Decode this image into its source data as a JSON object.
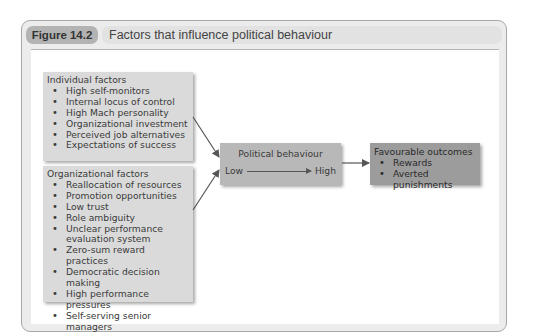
{
  "header": {
    "figure_label": "Figure 14.2",
    "title": "Factors that influence political behaviour"
  },
  "individual_factors": {
    "heading": "Individual factors",
    "items": [
      "High self-monitors",
      "Internal locus of control",
      "High Mach personality",
      "Organizational investment",
      "Perceived job alternatives",
      "Expectations of success"
    ]
  },
  "organizational_factors": {
    "heading": "Organizational factors",
    "items": [
      "Reallocation of resources",
      "Promotion opportunities",
      "Low trust",
      "Role ambiguity",
      "Unclear performance evaluation system",
      "Zero-sum reward practices",
      "Democratic decision making",
      "High performance pressures",
      "Self-serving senior managers"
    ]
  },
  "political_behaviour": {
    "heading": "Political behaviour",
    "low": "Low",
    "high": "High"
  },
  "outcomes": {
    "heading": "Favourable outcomes",
    "items": [
      "Rewards",
      "Averted punishments"
    ]
  },
  "colors": {
    "figure_tag": "#b3b3b3",
    "title_bar": "#e2e2e2",
    "factor_box": "#dadada",
    "political_box": "#b8b8b8",
    "outcome_box": "#9c9c9c",
    "arrow": "#555555"
  }
}
